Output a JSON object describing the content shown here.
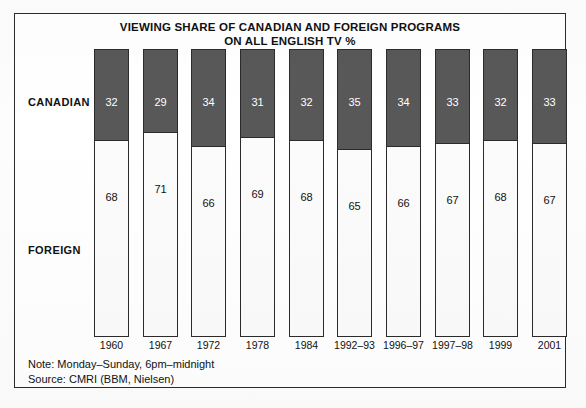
{
  "chart_data": {
    "type": "bar",
    "subtype": "stacked-100-percent",
    "title": "VIEWING SHARE OF CANADIAN AND FOREIGN PROGRAMS ON ALL ENGLISH TV %",
    "title_lines": [
      "VIEWING SHARE OF CANADIAN AND FOREIGN PROGRAMS",
      "ON ALL ENGLISH TV %"
    ],
    "xlabel": "",
    "ylabel": "",
    "ylim": [
      0,
      100
    ],
    "grid": false,
    "legend_position": "left-inline",
    "categories": [
      "1960",
      "1967",
      "1972",
      "1978",
      "1984",
      "1992–93",
      "1996–97",
      "1997–98",
      "1999",
      "2001"
    ],
    "series": [
      {
        "name": "CANADIAN",
        "color": "#585858",
        "text_color": "#ffffff",
        "values": [
          32,
          29,
          34,
          31,
          32,
          35,
          34,
          33,
          32,
          33
        ]
      },
      {
        "name": "FOREIGN",
        "color": "#fbfbfb",
        "text_color": "#111111",
        "values": [
          68,
          71,
          66,
          69,
          68,
          65,
          66,
          67,
          68,
          67
        ]
      }
    ],
    "annotations": [
      "Note: Monday–Sunday, 6pm–midnight",
      "Source: CMRI (BBM, Nielsen)"
    ]
  },
  "footnotes": {
    "note": "Note: Monday–Sunday, 6pm–midnight",
    "source": "Source: CMRI (BBM, Nielsen)"
  },
  "colors": {
    "canadian_fill": "#585858",
    "foreign_fill": "#fbfbfb",
    "outline": "#2b2b2b",
    "text": "#111111"
  }
}
